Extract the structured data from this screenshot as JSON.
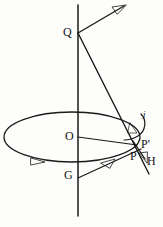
{
  "figure": {
    "background_color": "#fdfdfb",
    "ink_color": "#1a1a1a",
    "width": 163,
    "height": 227
  },
  "labels": {
    "q": "Q",
    "o": "O",
    "g": "G",
    "p": "P",
    "p_prime": "P'",
    "h": "H",
    "j": "j"
  },
  "geometry": {
    "axis": {
      "name": "vertical-spin-axis",
      "x": 78,
      "y_top": 5,
      "y_bottom": 216
    },
    "ellipse": {
      "name": "precession-orbit",
      "cx": 72,
      "cy": 137,
      "rx": 68,
      "ry": 25
    },
    "points": {
      "Q": {
        "x": 78,
        "y": 33
      },
      "O": {
        "x": 78,
        "y": 137
      },
      "G": {
        "x": 78,
        "y": 176
      },
      "P": {
        "x": 136,
        "y": 146
      },
      "P_prime": {
        "x": 140,
        "y": 143
      }
    },
    "vectors": [
      {
        "name": "angular-momentum-arrow",
        "from": [
          78,
          33
        ],
        "to": [
          126,
          5
        ]
      },
      {
        "name": "q-to-p-line",
        "from": [
          78,
          33
        ],
        "to": [
          148,
          172
        ]
      },
      {
        "name": "o-to-p-radius",
        "from": [
          78,
          137
        ],
        "to": [
          138,
          144
        ]
      },
      {
        "name": "p-to-g-arrow",
        "from": [
          140,
          148
        ],
        "to": [
          78,
          177
        ]
      },
      {
        "name": "h-torque-arrow",
        "from": [
          134,
          142
        ],
        "to": [
          146,
          160
        ]
      },
      {
        "name": "orbit-direction-arrow",
        "at": [
          38,
          160
        ]
      },
      {
        "name": "spin-curl-arrow",
        "at": [
          137,
          124
        ]
      }
    ]
  }
}
